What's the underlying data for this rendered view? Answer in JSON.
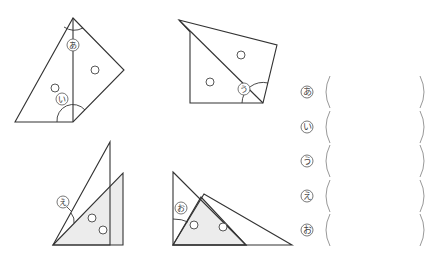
{
  "figures": [
    {
      "id": "fig1",
      "angle_labels": [
        {
          "key": "a",
          "text": "あ"
        },
        {
          "key": "i",
          "text": "い"
        }
      ]
    },
    {
      "id": "fig2",
      "angle_labels": [
        {
          "key": "u",
          "text": "う"
        }
      ]
    },
    {
      "id": "fig3",
      "angle_labels": [
        {
          "key": "e",
          "text": "え"
        }
      ]
    },
    {
      "id": "fig4",
      "angle_labels": [
        {
          "key": "o",
          "text": "お"
        }
      ]
    }
  ],
  "answers": [
    {
      "label": "あ",
      "value": ""
    },
    {
      "label": "い",
      "value": ""
    },
    {
      "label": "う",
      "value": ""
    },
    {
      "label": "え",
      "value": ""
    },
    {
      "label": "お",
      "value": ""
    }
  ],
  "colors": {
    "line": "#333333",
    "shade": "#ececec",
    "paren": "#999999"
  }
}
